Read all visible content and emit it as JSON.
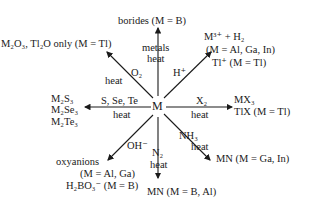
{
  "center": "M",
  "products": {
    "top": "borides (M = B)",
    "top_left": "M₂O₃, Tl₂O only (M = Tl)",
    "top_right_1": "M³⁺ + H₂",
    "top_right_2": "(M = Al, Ga, In)",
    "top_right_3": "Tl⁺ (M = Tl)",
    "left_1": "M₂S₃",
    "left_2": "M₂Se₃",
    "left_3": "M₂Te₃",
    "right_1": "MX₃",
    "right_2": "TlX (M = Tl)",
    "bottom_left_1": "oxyanions",
    "bottom_left_2": "(M = Al, Ga)",
    "bottom_left_3": "H₂BO₃⁻ (M = B)",
    "bottom": "MN (M = B, Al)",
    "bottom_right": "MN (M = Ga, In)"
  },
  "reagents": {
    "top_1": "metals",
    "top_2": "heat",
    "top_left_1": "O₂",
    "top_left_2": "heat",
    "top_right": "H⁺",
    "left_1": "S, Se, Te",
    "left_2": "heat",
    "right_1": "X₂",
    "right_2": "heat",
    "bottom_left": "OH⁻",
    "bottom_1": "N₂",
    "bottom_2": "heat",
    "bottom_right_1": "NH₃",
    "bottom_right_2": "heat"
  }
}
